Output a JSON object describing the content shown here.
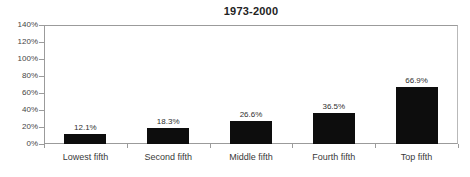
{
  "chart_data": {
    "type": "bar",
    "title": "1973-2000",
    "xlabel": "",
    "ylabel": "",
    "categories": [
      "Lowest fifth",
      "Second fifth",
      "Middle fifth",
      "Fourth fifth",
      "Top fifth"
    ],
    "values": [
      12.1,
      18.3,
      26.6,
      36.5,
      66.9
    ],
    "value_labels": [
      "12.1%",
      "18.3%",
      "26.6%",
      "36.5%",
      "66.9%"
    ],
    "series": [
      {
        "name": "1973-2000",
        "values": [
          12.1,
          18.3,
          26.6,
          36.5,
          66.9
        ]
      }
    ],
    "ylim": [
      0,
      140
    ],
    "ytick_values": [
      0,
      20,
      40,
      60,
      80,
      100,
      120,
      140
    ],
    "ytick_labels": [
      "0%",
      "20%",
      "40%",
      "60%",
      "80%",
      "100%",
      "120%",
      "140%"
    ],
    "grid": false,
    "legend": false,
    "legend_position": "none",
    "bar_color": "#0d0d0d",
    "axis_color": "#9b9b9b",
    "background_color": "#ffffff"
  }
}
